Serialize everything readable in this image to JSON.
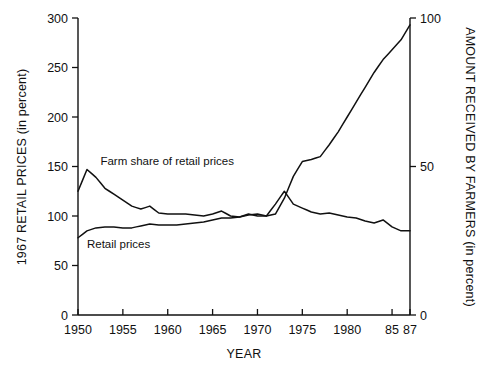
{
  "chart_data": {
    "type": "line",
    "title": "",
    "xlabel": "YEAR",
    "ylabel": "1967 RETAIL PRICES (in percent)",
    "ylabel_right": "AMOUNT RECEIVED BY FARMERS (in percent)",
    "grid": false,
    "legend_position": "inline-annotations",
    "xlim": [
      1950,
      1987
    ],
    "ylim": [
      0,
      300
    ],
    "ylim_right": [
      0,
      100
    ],
    "xticks": [
      1950,
      1955,
      1960,
      1965,
      1970,
      1975,
      1980,
      1985,
      1987
    ],
    "xticklabels": [
      "1950",
      "1955",
      "1960",
      "1965",
      "1970",
      "1975",
      "1980",
      "85",
      "87"
    ],
    "yticks": [
      0,
      50,
      100,
      150,
      200,
      250,
      300
    ],
    "yticklabels": [
      "0",
      "50",
      "100",
      "150",
      "200",
      "250",
      "300"
    ],
    "yticks_right": [
      0,
      50,
      100
    ],
    "yticklabels_right": [
      "0",
      "50",
      "100"
    ],
    "x": [
      1950,
      1951,
      1952,
      1953,
      1954,
      1955,
      1956,
      1957,
      1958,
      1959,
      1960,
      1961,
      1962,
      1963,
      1964,
      1965,
      1966,
      1967,
      1968,
      1969,
      1970,
      1971,
      1972,
      1973,
      1974,
      1975,
      1976,
      1977,
      1978,
      1979,
      1980,
      1981,
      1982,
      1983,
      1984,
      1985,
      1986,
      1987
    ],
    "series": [
      {
        "name": "Farm share of retail prices",
        "label_text": "Farm share of retail prices",
        "axis": "left",
        "values": [
          125,
          147,
          139,
          128,
          122,
          116,
          110,
          107,
          110,
          103,
          102,
          102,
          102,
          101,
          100,
          102,
          105,
          100,
          99,
          102,
          100,
          100,
          112,
          125,
          112,
          108,
          104,
          102,
          103,
          101,
          99,
          98,
          95,
          93,
          96,
          89,
          85,
          85
        ]
      },
      {
        "name": "Retail prices",
        "label_text": "Retail prices",
        "axis": "left",
        "values": [
          78,
          85,
          88,
          89,
          89,
          88,
          88,
          90,
          92,
          91,
          91,
          91,
          92,
          93,
          94,
          96,
          98,
          98,
          99,
          101,
          102,
          100,
          102,
          118,
          140,
          155,
          157,
          160,
          172,
          185,
          200,
          215,
          230,
          245,
          258,
          268,
          278,
          293
        ]
      }
    ],
    "annotations": [
      {
        "text": "Farm share of retail prices",
        "x": 1952.5,
        "y": 152
      },
      {
        "text": "Retail prices",
        "x": 1951.0,
        "y": 68
      }
    ],
    "colors": {
      "line": "#111111",
      "axis": "#111111",
      "background": "#ffffff"
    }
  },
  "axes": {
    "left_title": "1967 RETAIL PRICES (in percent)",
    "right_title": "AMOUNT RECEIVED BY FARMERS (in percent)",
    "bottom_title": "YEAR"
  }
}
